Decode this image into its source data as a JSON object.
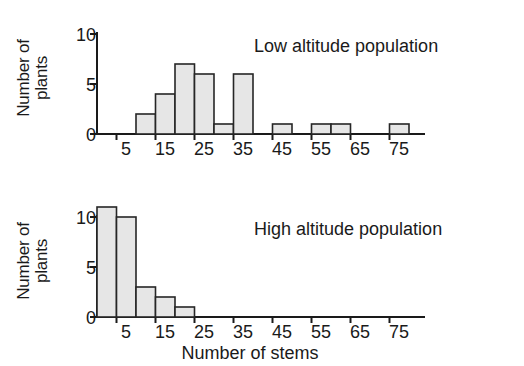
{
  "chart_data": [
    {
      "type": "bar",
      "title": "Low altitude population",
      "xlabel": "",
      "ylabel": "Number of\nplants",
      "xlim": [
        0,
        85
      ],
      "ylim": [
        0,
        11
      ],
      "yticks": [
        0,
        5,
        10
      ],
      "ytick_labels": [
        "0",
        "5",
        "10"
      ],
      "xticks": [
        5,
        15,
        25,
        35,
        45,
        55,
        65,
        75
      ],
      "xtick_labels": [
        "5",
        "15",
        "25",
        "35",
        "45",
        "55",
        "65",
        "75"
      ],
      "grid": false,
      "bin_width": 5,
      "bins": [
        {
          "start": 0,
          "end": 5,
          "value": 0
        },
        {
          "start": 5,
          "end": 10,
          "value": 0
        },
        {
          "start": 10,
          "end": 15,
          "value": 2
        },
        {
          "start": 15,
          "end": 20,
          "value": 4
        },
        {
          "start": 20,
          "end": 25,
          "value": 7
        },
        {
          "start": 25,
          "end": 30,
          "value": 6
        },
        {
          "start": 30,
          "end": 35,
          "value": 1
        },
        {
          "start": 35,
          "end": 40,
          "value": 6
        },
        {
          "start": 40,
          "end": 45,
          "value": 0
        },
        {
          "start": 45,
          "end": 50,
          "value": 1
        },
        {
          "start": 50,
          "end": 55,
          "value": 0
        },
        {
          "start": 55,
          "end": 60,
          "value": 1
        },
        {
          "start": 60,
          "end": 65,
          "value": 1
        },
        {
          "start": 65,
          "end": 70,
          "value": 0
        },
        {
          "start": 70,
          "end": 75,
          "value": 0
        },
        {
          "start": 75,
          "end": 80,
          "value": 1
        }
      ]
    },
    {
      "type": "bar",
      "title": "High altitude population",
      "xlabel": "Number of stems",
      "ylabel": "Number of\nplants",
      "xlim": [
        0,
        85
      ],
      "ylim": [
        0,
        11
      ],
      "yticks": [
        0,
        5,
        10
      ],
      "ytick_labels": [
        "0",
        "5",
        "10"
      ],
      "xticks": [
        5,
        15,
        25,
        35,
        45,
        55,
        65,
        75
      ],
      "xtick_labels": [
        "5",
        "15",
        "25",
        "35",
        "45",
        "55",
        "65",
        "75"
      ],
      "grid": false,
      "bin_width": 5,
      "bins": [
        {
          "start": 0,
          "end": 5,
          "value": 11
        },
        {
          "start": 5,
          "end": 10,
          "value": 10
        },
        {
          "start": 10,
          "end": 15,
          "value": 3
        },
        {
          "start": 15,
          "end": 20,
          "value": 2
        },
        {
          "start": 20,
          "end": 25,
          "value": 1
        },
        {
          "start": 25,
          "end": 30,
          "value": 0
        },
        {
          "start": 30,
          "end": 35,
          "value": 0
        },
        {
          "start": 35,
          "end": 40,
          "value": 0
        },
        {
          "start": 40,
          "end": 45,
          "value": 0
        },
        {
          "start": 45,
          "end": 50,
          "value": 0
        },
        {
          "start": 50,
          "end": 55,
          "value": 0
        },
        {
          "start": 55,
          "end": 60,
          "value": 0
        },
        {
          "start": 60,
          "end": 65,
          "value": 0
        },
        {
          "start": 65,
          "end": 70,
          "value": 0
        },
        {
          "start": 70,
          "end": 75,
          "value": 0
        },
        {
          "start": 75,
          "end": 80,
          "value": 0
        }
      ]
    }
  ],
  "style": {
    "bar_fill": "#e6e6e6",
    "bar_stroke": "#262626",
    "axis_color": "#1a1a1a",
    "text_color": "#1a1a1a",
    "background": "#ffffff"
  },
  "panels": {
    "top": {
      "legend": "Low altitude population",
      "ylabel": "Number of\nplants",
      "ytick_labels": [
        "10",
        "5",
        "0"
      ],
      "xtick_labels": [
        "5",
        "15",
        "25",
        "35",
        "45",
        "55",
        "65",
        "75"
      ]
    },
    "bottom": {
      "legend": "High altitude population",
      "ylabel": "Number of\nplants",
      "ytick_labels": [
        "10",
        "5",
        "0"
      ],
      "xtick_labels": [
        "5",
        "15",
        "25",
        "35",
        "45",
        "55",
        "65",
        "75"
      ],
      "xtitle": "Number of stems"
    }
  }
}
